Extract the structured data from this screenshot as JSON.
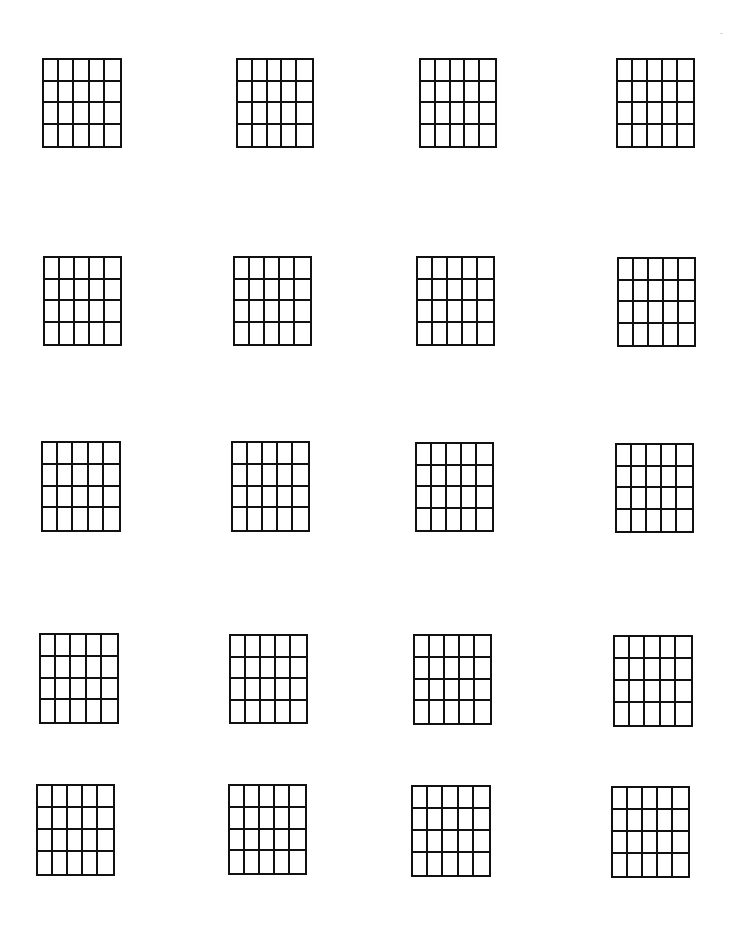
{
  "page": {
    "type": "blank chord chart worksheet",
    "background": "#ffffff",
    "line_color": "#111111"
  },
  "grid_spec": {
    "columns": 5,
    "rows": 4,
    "vertical_lines": 6,
    "horizontal_lines": 5
  },
  "grids": [
    {
      "row": 1,
      "col": 1,
      "x": 42,
      "y": 58,
      "w": 80,
      "h": 90
    },
    {
      "row": 1,
      "col": 2,
      "x": 236,
      "y": 58,
      "w": 78,
      "h": 90
    },
    {
      "row": 1,
      "col": 3,
      "x": 419,
      "y": 58,
      "w": 78,
      "h": 90
    },
    {
      "row": 1,
      "col": 4,
      "x": 616,
      "y": 58,
      "w": 79,
      "h": 90
    },
    {
      "row": 2,
      "col": 1,
      "x": 43,
      "y": 256,
      "w": 79,
      "h": 90
    },
    {
      "row": 2,
      "col": 2,
      "x": 233,
      "y": 256,
      "w": 79,
      "h": 90
    },
    {
      "row": 2,
      "col": 3,
      "x": 416,
      "y": 256,
      "w": 79,
      "h": 90
    },
    {
      "row": 2,
      "col": 4,
      "x": 617,
      "y": 257,
      "w": 79,
      "h": 90
    },
    {
      "row": 3,
      "col": 1,
      "x": 41,
      "y": 441,
      "w": 80,
      "h": 91
    },
    {
      "row": 3,
      "col": 2,
      "x": 231,
      "y": 441,
      "w": 79,
      "h": 91
    },
    {
      "row": 3,
      "col": 3,
      "x": 415,
      "y": 442,
      "w": 79,
      "h": 90
    },
    {
      "row": 3,
      "col": 4,
      "x": 615,
      "y": 443,
      "w": 79,
      "h": 90
    },
    {
      "row": 4,
      "col": 1,
      "x": 39,
      "y": 633,
      "w": 80,
      "h": 91
    },
    {
      "row": 4,
      "col": 2,
      "x": 229,
      "y": 634,
      "w": 79,
      "h": 90
    },
    {
      "row": 4,
      "col": 3,
      "x": 413,
      "y": 634,
      "w": 79,
      "h": 91
    },
    {
      "row": 4,
      "col": 4,
      "x": 613,
      "y": 635,
      "w": 80,
      "h": 92
    },
    {
      "row": 5,
      "col": 1,
      "x": 36,
      "y": 784,
      "w": 79,
      "h": 92
    },
    {
      "row": 5,
      "col": 2,
      "x": 228,
      "y": 784,
      "w": 79,
      "h": 91
    },
    {
      "row": 5,
      "col": 3,
      "x": 411,
      "y": 785,
      "w": 80,
      "h": 92
    },
    {
      "row": 5,
      "col": 4,
      "x": 611,
      "y": 786,
      "w": 79,
      "h": 92
    }
  ],
  "specks": [
    {
      "x": 720,
      "y": 33
    }
  ]
}
